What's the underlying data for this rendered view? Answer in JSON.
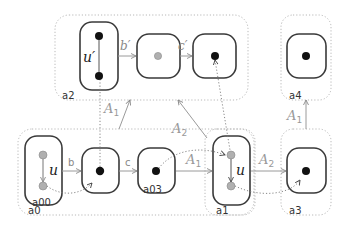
{
  "diagram": {
    "groups": [
      {
        "id": "a2",
        "label": "a2"
      },
      {
        "id": "a4",
        "label": "a4"
      },
      {
        "id": "a0",
        "label": "a0"
      },
      {
        "id": "a1",
        "label": "a1"
      },
      {
        "id": "a3",
        "label": "a3"
      }
    ],
    "node_labels": {
      "a00": "a00",
      "a03": "a03"
    },
    "edge_labels": {
      "u_prime": "u′",
      "b_prime": "b′",
      "c_prime": "c′",
      "u_bottom": "u",
      "b": "b",
      "c": "c",
      "u_a1": "u",
      "A1_upper": "A",
      "A1_upper_sub": "1",
      "A2_upper": "A",
      "A2_upper_sub": "2",
      "A1_mid": "A",
      "A1_mid_sub": "1",
      "A2_mid": "A",
      "A2_mid_sub": "2",
      "A1_right": "A",
      "A1_right_sub": "1"
    },
    "colors": {
      "node_stroke": "#3a3a3a",
      "group_stroke": "#b8b8b8",
      "dot_black": "#111111",
      "dot_gray": "#b0b0b0",
      "arrow_gray": "#9a9a9a"
    }
  }
}
